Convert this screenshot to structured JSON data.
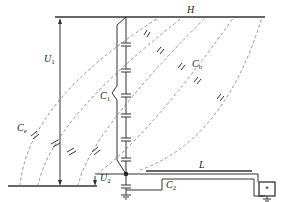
{
  "diagram": {
    "labels": {
      "H": "H",
      "L": "L",
      "U1": "U",
      "U1_sub": "1",
      "U2": "U",
      "U2_sub": "2",
      "C1": "C",
      "C1_sub": "1",
      "C2": "C",
      "C2_sub": "2",
      "Cb": "C",
      "Cb_sub": "b",
      "Ce": "C",
      "Ce_sub": "e",
      "meter": "*"
    },
    "colors": {
      "line": "#333333",
      "dashed": "#777777",
      "background": "#ffffff"
    }
  }
}
